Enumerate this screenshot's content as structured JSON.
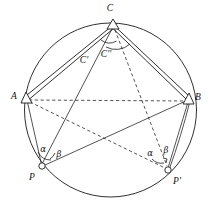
{
  "figure": {
    "type": "geometric-diagram",
    "stroke_color": "#1a1a1a",
    "background_color": "#ffffff",
    "circle": {
      "cx": 110.5,
      "cy": 110,
      "r": 86
    },
    "points": {
      "C": {
        "x": 113,
        "y": 24,
        "label": "C",
        "marker": "triangle",
        "label_x": 110,
        "label_y": 11
      },
      "A": {
        "x": 26,
        "y": 97,
        "label": "A",
        "marker": "triangle",
        "label_x": 14,
        "label_y": 99
      },
      "B": {
        "x": 189,
        "y": 98,
        "label": "B",
        "marker": "triangle",
        "label_x": 196,
        "label_y": 100
      },
      "P": {
        "x": 42,
        "y": 166,
        "label": "P",
        "marker": "dot",
        "label_x": 32,
        "label_y": 179
      },
      "Pp": {
        "x": 168,
        "y": 170,
        "label": "P'",
        "marker": "dot",
        "label_x": 173,
        "label_y": 183
      },
      "Cp": {
        "label": "C'",
        "label_x": 84,
        "label_y": 61
      },
      "Cpp": {
        "label": "C''",
        "label_x": 104,
        "label_y": 56
      }
    },
    "angles": [
      {
        "name": "alpha-at-P",
        "label": "α",
        "label_x": 43,
        "label_y": 150
      },
      {
        "name": "beta-at-P",
        "label": "β",
        "label_x": 58,
        "label_y": 155
      },
      {
        "name": "alpha-at-Pprime",
        "label": "α",
        "label_x": 149,
        "label_y": 154
      },
      {
        "name": "beta-at-Pprime",
        "label": "β",
        "label_x": 165,
        "label_y": 152
      }
    ],
    "segments": [
      {
        "name": "chord-A-C",
        "style": "double-solid"
      },
      {
        "name": "chord-C-B",
        "style": "double-solid"
      },
      {
        "name": "chord-A-B",
        "style": "dashed"
      },
      {
        "name": "chord-A-P",
        "style": "solid"
      },
      {
        "name": "chord-P-C",
        "style": "solid"
      },
      {
        "name": "chord-P-B",
        "style": "solid"
      },
      {
        "name": "chord-C-Pprime",
        "style": "dashed"
      },
      {
        "name": "chord-A-Pprime",
        "style": "dashed"
      },
      {
        "name": "chord-Pprime-B",
        "style": "solid"
      }
    ]
  }
}
